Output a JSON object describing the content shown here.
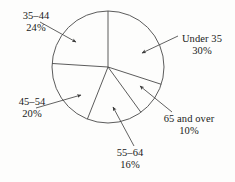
{
  "chart_data": {
    "type": "pie",
    "title": "",
    "subtitle": "",
    "xlabel": "",
    "ylabel": "",
    "grid": false,
    "legend_position": "callout-labels",
    "units": "percent",
    "total": 100,
    "categories": [
      "Under 35",
      "65 and over",
      "55–64",
      "45–54",
      "35–44"
    ],
    "values": [
      30,
      10,
      16,
      20,
      24
    ],
    "slices": [
      {
        "label": "Under 35",
        "value": 30,
        "value_text": "30%",
        "start_angle_deg": 0,
        "end_angle_deg": 108,
        "fill": "none",
        "stroke": "#4a4a4a"
      },
      {
        "label": "65 and over",
        "value": 10,
        "value_text": "10%",
        "start_angle_deg": 108,
        "end_angle_deg": 144,
        "fill": "none",
        "stroke": "#4a4a4a"
      },
      {
        "label": "55–64",
        "value": 16,
        "value_text": "16%",
        "start_angle_deg": 144,
        "end_angle_deg": 201.6,
        "fill": "none",
        "stroke": "#4a4a4a"
      },
      {
        "label": "45–54",
        "value": 20,
        "value_text": "20%",
        "start_angle_deg": 201.6,
        "end_angle_deg": 273.6,
        "fill": "none",
        "stroke": "#4a4a4a"
      },
      {
        "label": "35–44",
        "value": 24,
        "value_text": "24%",
        "start_angle_deg": 273.6,
        "end_angle_deg": 360,
        "fill": "none",
        "stroke": "#4a4a4a"
      }
    ],
    "style": {
      "background": "#fdfdfc",
      "line_color": "#4a4a4a",
      "text_color": "#1a1a1a",
      "line_width": 0.9
    }
  },
  "callouts": {
    "under_35": {
      "name": "Under 35",
      "percent": "30%"
    },
    "age_35_44": {
      "name": "35–44",
      "percent": "24%"
    },
    "age_45_54": {
      "name": "45–54",
      "percent": "20%"
    },
    "age_55_64": {
      "name": "55–64",
      "percent": "16%"
    },
    "age_65_over": {
      "name": "65 and over",
      "percent": "10%"
    }
  }
}
